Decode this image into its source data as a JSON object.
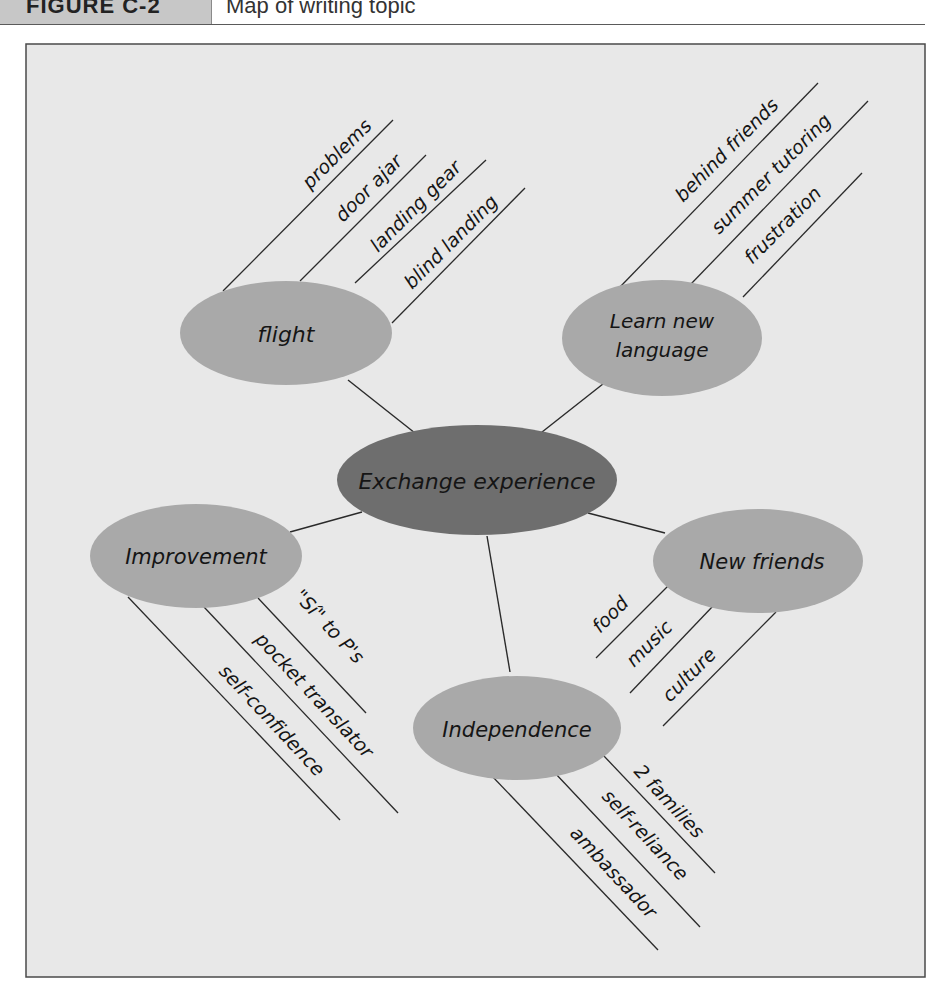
{
  "figure": {
    "label": "FIGURE C-2",
    "caption": "Map of writing topic"
  },
  "colors": {
    "frame_bg": "#e8e8e8",
    "frame_border": "#4a4a4a",
    "center_node": "#6e6e6e",
    "topic_node": "#a9a9a9",
    "line": "#2a2a2a",
    "text": "#151515"
  },
  "map": {
    "center": {
      "label": "Exchange experience"
    },
    "topics": [
      {
        "label": "flight",
        "details": [
          "problems",
          "door ajar",
          "landing gear",
          "blind landing"
        ]
      },
      {
        "label_line1": "Learn new",
        "label_line2": "language",
        "details": [
          "behind friends",
          "summer tutoring",
          "frustration"
        ]
      },
      {
        "label": "Improvement",
        "details": [
          "\"Sí\" to P's",
          "pocket translator",
          "self-confidence"
        ]
      },
      {
        "label": "New friends",
        "details": [
          "food",
          "music",
          "culture"
        ]
      },
      {
        "label": "Independence",
        "details": [
          "2 families",
          "self-reliance",
          "ambassador"
        ]
      }
    ]
  }
}
